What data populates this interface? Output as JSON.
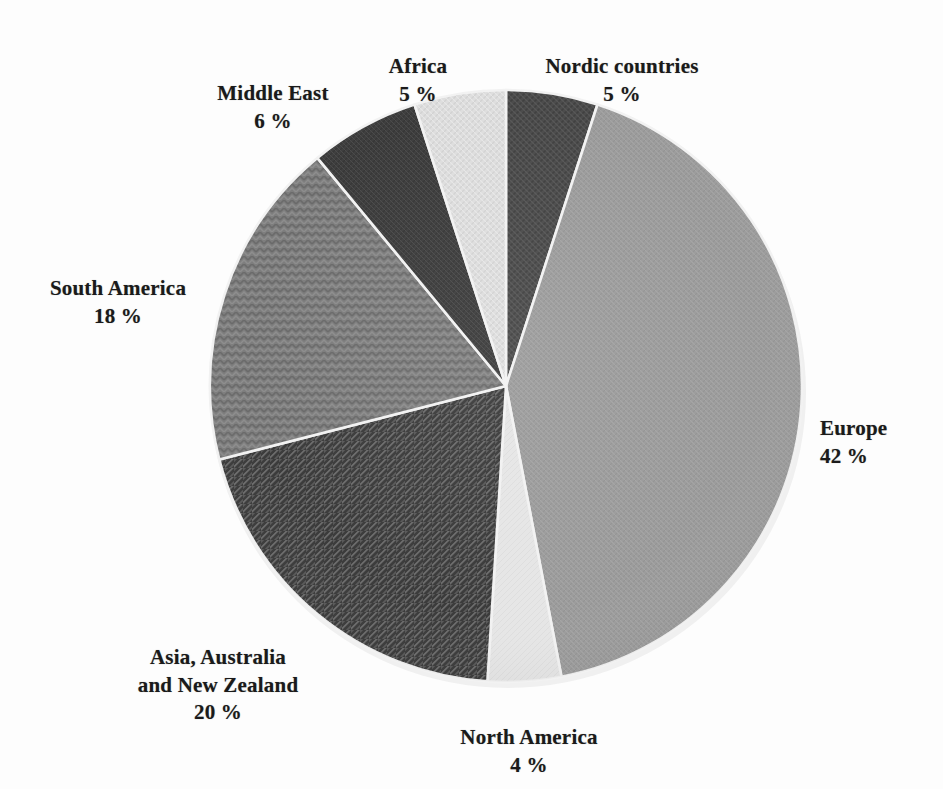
{
  "chart_data": {
    "type": "pie",
    "title": "",
    "unit": "%",
    "start_angle_deg": 0,
    "direction": "clockwise",
    "legend": "none",
    "labels_position": "outside",
    "categories": [
      "Nordic countries",
      "Europe",
      "North America",
      "Asia, Australia\nand New Zealand",
      "South America",
      "Middle East",
      "Africa"
    ],
    "values": [
      5,
      42,
      4,
      20,
      18,
      6,
      5
    ],
    "value_labels": [
      "5 %",
      "42 %",
      "4 %",
      "20 %",
      "18 %",
      "6 %",
      "5 %"
    ],
    "slices": [
      {
        "name": "Nordic countries",
        "value": 5,
        "value_label": "5 %",
        "label_text": "Nordic countries",
        "start_deg": 0.0,
        "end_deg": 18.0,
        "color": "#4a4a4a",
        "pattern": "fine-crosshatch-dark"
      },
      {
        "name": "Europe",
        "value": 42,
        "value_label": "42 %",
        "label_text": "Europe",
        "start_deg": 18.0,
        "end_deg": 169.2,
        "color": "#9b9b9b",
        "pattern": "fine-crosshatch-light"
      },
      {
        "name": "North America",
        "value": 4,
        "value_label": "4 %",
        "label_text": "North America",
        "start_deg": 169.2,
        "end_deg": 183.6,
        "color": "#e3e3e3",
        "pattern": "plain-pale"
      },
      {
        "name": "Asia, Australia and New Zealand",
        "value": 20,
        "value_label": "20 %",
        "label_text": "Asia, Australia\nand New Zealand",
        "start_deg": 183.6,
        "end_deg": 255.6,
        "color": "#5d5d5d",
        "pattern": "diagonal-hatch"
      },
      {
        "name": "South America",
        "value": 18,
        "value_label": "18 %",
        "label_text": "South America",
        "start_deg": 255.6,
        "end_deg": 320.4,
        "color": "#7b7b7b",
        "pattern": "chevron-weave"
      },
      {
        "name": "Middle East",
        "value": 6,
        "value_label": "6 %",
        "label_text": "Middle East",
        "start_deg": 320.4,
        "end_deg": 342.0,
        "color": "#3f3f3f",
        "pattern": "dense-dark"
      },
      {
        "name": "Africa",
        "value": 5,
        "value_label": "5 %",
        "label_text": "Africa",
        "start_deg": 342.0,
        "end_deg": 360.0,
        "color": "#dcdcdc",
        "pattern": "pale-crosshatch"
      }
    ],
    "geometry": {
      "center_x": 506,
      "center_y": 386,
      "radius": 296
    },
    "colors": {
      "background": "#fdfdfd",
      "text": "#1a1a1a",
      "separator": "#f2f2f2"
    }
  },
  "labels": {
    "nordic": {
      "name": "Nordic countries",
      "pct": "5 %"
    },
    "africa": {
      "name": "Africa",
      "pct": "5 %"
    },
    "middle_east": {
      "name": "Middle East",
      "pct": "6 %"
    },
    "south_america": {
      "name": "South America",
      "pct": "18 %"
    },
    "asia": {
      "name": "Asia, Australia\nand New Zealand",
      "pct": "20 %"
    },
    "north_america": {
      "name": "North America",
      "pct": "4 %"
    },
    "europe": {
      "name": "Europe",
      "pct": "42 %"
    }
  }
}
